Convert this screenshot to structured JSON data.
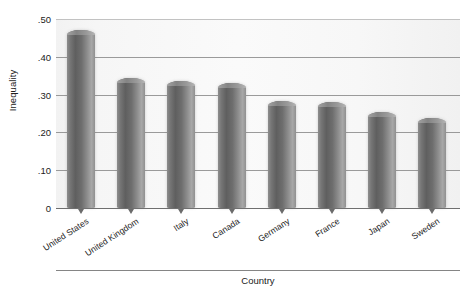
{
  "chart_data": {
    "type": "bar",
    "title": "",
    "xlabel": "Country",
    "ylabel": "Inequality",
    "categories": [
      "United States",
      "United Kingdom",
      "Italy",
      "Canada",
      "Germany",
      "France",
      "Japan",
      "Sweden"
    ],
    "values": [
      0.47,
      0.345,
      0.335,
      0.332,
      0.283,
      0.281,
      0.255,
      0.237
    ],
    "ylim": [
      0,
      0.5
    ],
    "yticks": [
      0,
      0.1,
      0.2,
      0.3,
      0.4,
      0.5
    ],
    "ytick_labels": [
      "0",
      ".10",
      ".20",
      ".30",
      ".40",
      ".50"
    ],
    "grid": true,
    "legend": "none",
    "bar_color": "#6e6e6e",
    "plot_background": "#f7f7f7"
  },
  "axes": {
    "y_title": "Inequality",
    "x_title": "Country"
  }
}
